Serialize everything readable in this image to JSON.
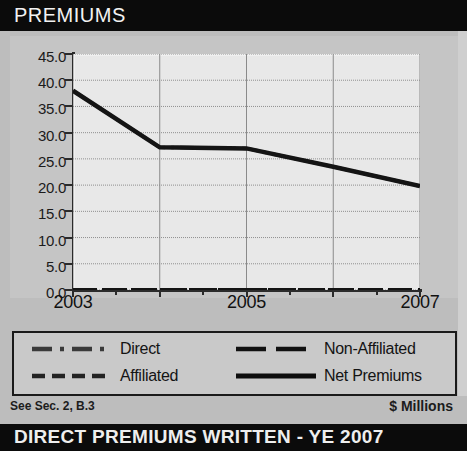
{
  "header": {
    "title": "PREMIUMS"
  },
  "footer": {
    "source_note": "See Sec. 2, B.3",
    "units": "$ Millions",
    "bottom_bar": "DIRECT PREMIUMS WRITTEN - YE 2007"
  },
  "legend": {
    "items": [
      {
        "label": "Direct",
        "style": "dash-dot",
        "color": "#3a3a3a"
      },
      {
        "label": "Non-Affiliated",
        "style": "long-dash",
        "color": "#111111"
      },
      {
        "label": "Affiliated",
        "style": "short-dash",
        "color": "#222222"
      },
      {
        "label": "Net Premiums",
        "style": "solid",
        "color": "#0d0d0d"
      }
    ]
  },
  "chart_data": {
    "type": "line",
    "title": "PREMIUMS",
    "xlabel": "",
    "ylabel": "",
    "units": "$ Millions",
    "x": [
      2003,
      2004,
      2005,
      2006,
      2007
    ],
    "tick_labels_x": [
      "2003",
      "",
      "2005",
      "",
      "2007"
    ],
    "tick_labels_y": [
      "0.0",
      "5.0",
      "10.0",
      "15.0",
      "20.0",
      "25.0",
      "30.0",
      "35.0",
      "40.0",
      "45.0"
    ],
    "ylim": [
      0,
      45
    ],
    "ystep": 5,
    "grid": true,
    "legend_position": "bottom",
    "series": [
      {
        "name": "Direct",
        "style": "dash-dot",
        "values": [
          38.0,
          27.2,
          27.0,
          23.5,
          19.8
        ]
      },
      {
        "name": "Affiliated",
        "style": "short-dash",
        "values": [
          0.0,
          0.0,
          0.0,
          0.0,
          0.0
        ]
      },
      {
        "name": "Non-Affiliated",
        "style": "long-dash",
        "values": [
          0.0,
          0.0,
          0.0,
          0.0,
          0.0
        ]
      },
      {
        "name": "Net Premiums",
        "style": "solid",
        "values": [
          38.0,
          27.2,
          27.0,
          23.5,
          19.8
        ]
      }
    ]
  }
}
